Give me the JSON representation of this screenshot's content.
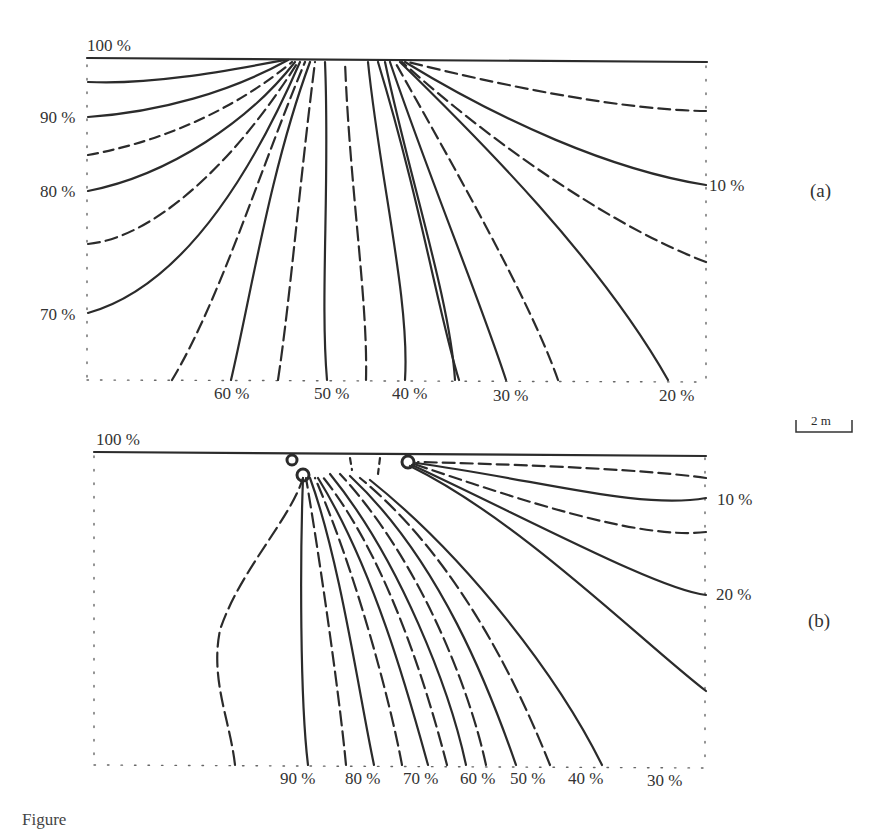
{
  "figure": {
    "panels": [
      {
        "id": "a",
        "tag": "(a)",
        "top_label": "100 %",
        "left_labels": [
          "90 %",
          "80 %",
          "70 %"
        ],
        "right_labels": [
          "10 %"
        ],
        "bottom_labels": [
          "60 %",
          "50 %",
          "40 %",
          "30 %",
          "20 %"
        ]
      },
      {
        "id": "b",
        "tag": "(b)",
        "top_label": "100 %",
        "right_labels": [
          "10 %",
          "20 %"
        ],
        "bottom_labels": [
          "90 %",
          "80 %",
          "70 %",
          "60 %",
          "50 %",
          "40 %",
          "30 %"
        ]
      }
    ],
    "scale_bar": {
      "label": "2 m"
    },
    "caption": "Figure"
  },
  "colors": {
    "line": "#2b2b2b",
    "border_dotted": "#555555",
    "background": "#ffffff"
  }
}
